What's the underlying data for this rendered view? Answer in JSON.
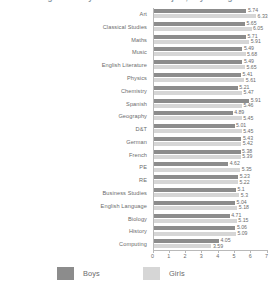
{
  "chart_data": {
    "type": "bar",
    "orientation": "horizontal",
    "title": "Average difficulty scores for each subject, boys and girls",
    "xlabel": "",
    "ylabel": "",
    "xlim": [
      0,
      7
    ],
    "xticks": [
      "0",
      "1",
      "2",
      "3",
      "4",
      "5",
      "6",
      "7"
    ],
    "grid": false,
    "legend_position": "bottom",
    "categories": [
      "Art",
      "Classical Studies",
      "Maths",
      "Music",
      "English Literature",
      "Physics",
      "Chemistry",
      "Spanish",
      "Geography",
      "D&T",
      "German",
      "French",
      "PE",
      "RE",
      "Business Studies",
      "English Language",
      "Biology",
      "History",
      "Computing"
    ],
    "series": [
      {
        "name": "Boys",
        "color": "#8c8c8c",
        "values": [
          5.74,
          5.65,
          5.71,
          5.49,
          5.49,
          5.41,
          5.21,
          5.91,
          4.89,
          5.01,
          5.43,
          5.38,
          4.62,
          5.23,
          5.1,
          5.04,
          4.71,
          5.06,
          4.05
        ]
      },
      {
        "name": "Girls",
        "color": "#d6d6d6",
        "values": [
          6.33,
          6.05,
          5.91,
          5.68,
          5.65,
          5.61,
          5.47,
          5.46,
          5.45,
          5.45,
          5.42,
          5.39,
          5.35,
          5.22,
          5.3,
          5.18,
          5.15,
          5.09,
          3.59
        ]
      }
    ],
    "value_labels": {
      "Boys": [
        "5.74",
        "5.65",
        "5.71",
        "5.49",
        "5.49",
        "5.41",
        "5.21",
        "5.91",
        "4.89",
        "5.01",
        "5.43",
        "5.38",
        "4.62",
        "5.23",
        "5.1",
        "5.04",
        "4.71",
        "5.06",
        "4.05"
      ],
      "Girls": [
        "6.33",
        "6.05",
        "5.91",
        "5.68",
        "5.65",
        "5.61",
        "5.47",
        "5.46",
        "5.45",
        "5.45",
        "5.42",
        "5.39",
        "5.35",
        "5.22",
        "5.3",
        "5.18",
        "5.15",
        "5.09",
        "3.59"
      ]
    }
  },
  "legend": {
    "items": [
      {
        "label": "Boys",
        "color": "#8c8c8c"
      },
      {
        "label": "Girls",
        "color": "#d6d6d6"
      }
    ]
  }
}
